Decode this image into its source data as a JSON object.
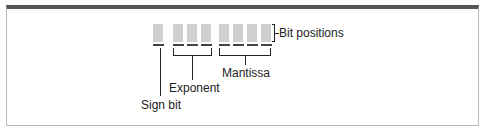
{
  "diagram": {
    "bit_box_color": "#cfcfcf",
    "groups": [
      {
        "name": "sign",
        "bits": 1
      },
      {
        "name": "exponent",
        "bits": 3
      },
      {
        "name": "mantissa",
        "bits": 4
      }
    ],
    "labels": {
      "bit_positions": "Bit positions",
      "mantissa": "Mantissa",
      "exponent": "Exponent",
      "sign_bit": "Sign bit"
    }
  }
}
